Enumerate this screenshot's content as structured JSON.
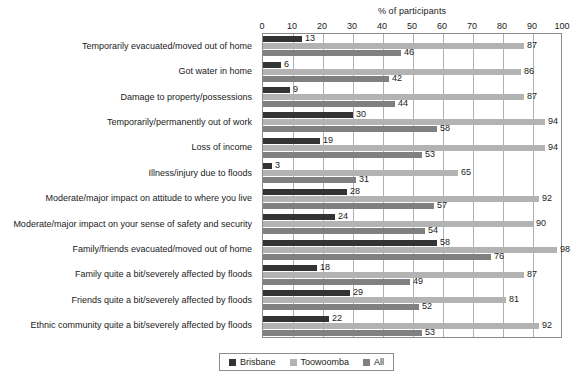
{
  "chart_data": {
    "type": "bar",
    "orientation": "horizontal",
    "title": "% of participants",
    "xlabel": "% of participants",
    "ylabel": "",
    "xlim": [
      0,
      100
    ],
    "xticks": [
      0,
      10,
      20,
      30,
      40,
      50,
      60,
      70,
      80,
      90,
      100
    ],
    "grid": true,
    "legend_position": "bottom",
    "categories": [
      "Temporarily evacuated/moved out of home",
      "Got water in home",
      "Damage to property/possessions",
      "Temporarily/permanently out of work",
      "Loss of income",
      "Illness/injury due to floods",
      "Moderate/major impact on attitude to where you live",
      "Moderate/major impact on your sense of safety and security",
      "Family/friends evacuated/moved out of home",
      "Family quite a bit/severely affected by floods",
      "Friends quite a bit/severely affected by floods",
      "Ethnic community quite a bit/severely affected by floods"
    ],
    "series": [
      {
        "name": "Brisbane",
        "color": "#333333",
        "values": [
          13,
          6,
          9,
          30,
          19,
          3,
          28,
          24,
          58,
          18,
          29,
          22
        ]
      },
      {
        "name": "Toowoomba",
        "color": "#b3b3b3",
        "values": [
          87,
          86,
          87,
          94,
          94,
          65,
          92,
          90,
          98,
          87,
          81,
          92
        ]
      },
      {
        "name": "All",
        "color": "#808080",
        "values": [
          46,
          42,
          44,
          58,
          53,
          31,
          57,
          54,
          76,
          49,
          52,
          53
        ]
      }
    ]
  },
  "legend": {
    "items": [
      {
        "label": "Brisbane",
        "color": "#333333"
      },
      {
        "label": "Toowoomba",
        "color": "#b3b3b3"
      },
      {
        "label": "All",
        "color": "#808080"
      }
    ]
  },
  "colors": {
    "axis": "#8c8c8c",
    "gridline": "#b0b0b0",
    "text": "#1a1a1a",
    "background": "#ffffff"
  }
}
